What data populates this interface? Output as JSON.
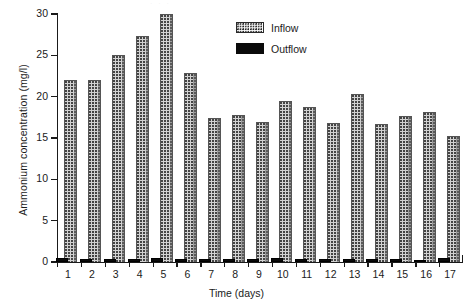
{
  "figure": {
    "top_artifact_text": "· · ·"
  },
  "chart_data": {
    "type": "bar",
    "title": "",
    "xlabel": "Time (days)",
    "ylabel": "Ammonium concentration (mg/l)",
    "categories": [
      "1",
      "2",
      "3",
      "4",
      "5",
      "6",
      "7",
      "8",
      "9",
      "10",
      "11",
      "12",
      "13",
      "14",
      "15",
      "16",
      "17"
    ],
    "series": [
      {
        "name": "Inflow",
        "color": "#d2d2d2",
        "pattern": "dotted-stipple",
        "values": [
          22.0,
          22.0,
          25.0,
          27.4,
          30.0,
          22.9,
          17.4,
          17.8,
          16.9,
          19.5,
          18.8,
          16.8,
          20.3,
          16.7,
          17.7,
          18.1,
          15.2
        ]
      },
      {
        "name": "Outflow",
        "color": "#0a0a0a",
        "pattern": "solid-black",
        "values": [
          0.45,
          0.4,
          0.4,
          0.4,
          0.45,
          0.4,
          0.4,
          0.4,
          0.4,
          0.45,
          0.4,
          0.35,
          0.4,
          0.35,
          0.35,
          0.25,
          0.5
        ]
      }
    ],
    "ylim": [
      0,
      30
    ],
    "yticks": [
      0,
      5,
      10,
      15,
      20,
      25,
      30
    ],
    "ytick_labels": [
      "0",
      "5",
      "10",
      "15",
      "20",
      "25",
      "30"
    ],
    "grid": false,
    "legend_position": "top-center-right",
    "legend_entries": [
      "Inflow",
      "Outflow"
    ]
  }
}
